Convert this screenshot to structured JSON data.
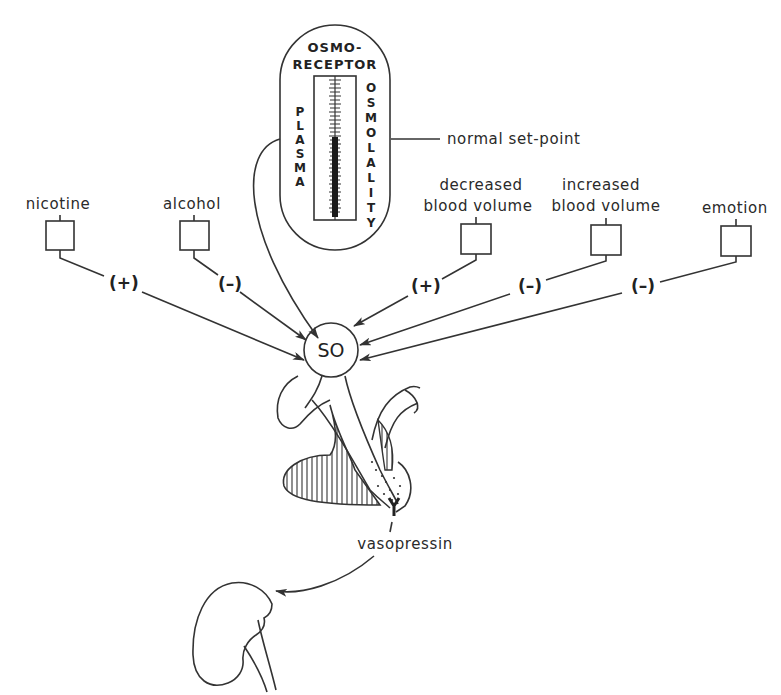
{
  "diagram": {
    "osmoreceptor": {
      "title_line1": "OSMO-",
      "title_line2": "RECEPTOR",
      "left_vertical": [
        "P",
        "L",
        "A",
        "S",
        "M",
        "A"
      ],
      "right_vertical": [
        "O",
        "S",
        "M",
        "O",
        "L",
        "A",
        "L",
        "I",
        "T",
        "Y"
      ],
      "setpoint_label": "normal set-point"
    },
    "center_node": {
      "label": "SO"
    },
    "inputs": [
      {
        "label_lines": [
          "nicotine"
        ],
        "effect": "(+)"
      },
      {
        "label_lines": [
          "alcohol"
        ],
        "effect": "(–)"
      },
      {
        "label_lines": [
          "decreased",
          "blood volume"
        ],
        "effect": "(+)"
      },
      {
        "label_lines": [
          "increased",
          "blood volume"
        ],
        "effect": "(–)"
      },
      {
        "label_lines": [
          "emotion"
        ],
        "effect": "(–)"
      }
    ],
    "output": {
      "hormone_label": "vasopressin",
      "target": "kidney"
    }
  }
}
